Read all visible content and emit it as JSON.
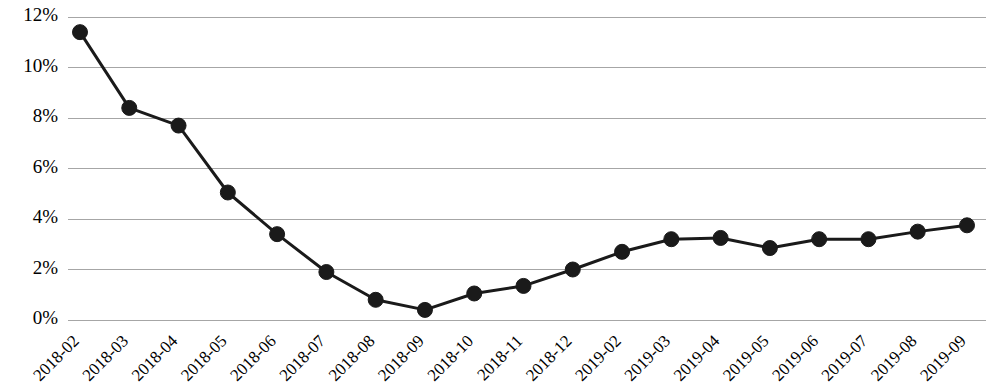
{
  "chart_data": {
    "type": "line",
    "title": "",
    "subtitle": "",
    "xlabel": "",
    "ylabel": "",
    "categories": [
      "2018-02",
      "2018-03",
      "2018-04",
      "2018-05",
      "2018-06",
      "2018-07",
      "2018-08",
      "2018-09",
      "2018-10",
      "2018-11",
      "2018-12",
      "2019-02",
      "2019-03",
      "2019-04",
      "2019-05",
      "2019-06",
      "2019-07",
      "2019-08",
      "2019-09"
    ],
    "values": [
      11.4,
      8.4,
      7.7,
      5.05,
      3.4,
      1.9,
      0.8,
      0.4,
      1.05,
      1.35,
      2.0,
      2.7,
      3.2,
      3.25,
      2.85,
      3.2,
      3.2,
      3.5,
      3.75
    ],
    "series": [
      {
        "name": "",
        "values": [
          11.4,
          8.4,
          7.7,
          5.05,
          3.4,
          1.9,
          0.8,
          0.4,
          1.05,
          1.35,
          2.0,
          2.7,
          3.2,
          3.25,
          2.85,
          3.2,
          3.2,
          3.5,
          3.75
        ],
        "color": "#1a1a1a",
        "marker": "circle"
      }
    ],
    "ytick_labels": [
      "0%",
      "2%",
      "4%",
      "6%",
      "8%",
      "10%",
      "12%"
    ],
    "ytick_values": [
      0,
      2,
      4,
      6,
      8,
      10,
      12
    ],
    "ylim": [
      0,
      12
    ],
    "value_unit": "%",
    "grid": {
      "horizontal": true,
      "vertical": false,
      "color": "#a6a6a6"
    },
    "legend": {
      "visible": false,
      "position": "none",
      "entries": []
    },
    "xtick_rotation_degrees": -45,
    "annotations": []
  },
  "style": {
    "line_color": "#1a1a1a",
    "marker_color": "#1a1a1a",
    "grid_color": "#a6a6a6",
    "background": "#ffffff",
    "text_color": "#000000"
  }
}
